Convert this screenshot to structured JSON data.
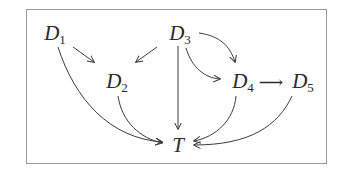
{
  "diagram": {
    "type": "directed-acyclic-graph",
    "colors": {
      "frame_border": "#9a9a9a",
      "edge": "#3a3a3a",
      "label": "#2a2a2a",
      "background": "#ffffff"
    },
    "nodes": [
      {
        "id": "D1",
        "base": "D",
        "sub": "1"
      },
      {
        "id": "D2",
        "base": "D",
        "sub": "2"
      },
      {
        "id": "D3",
        "base": "D",
        "sub": "3"
      },
      {
        "id": "D4",
        "base": "D",
        "sub": "4"
      },
      {
        "id": "D5",
        "base": "D",
        "sub": "5"
      },
      {
        "id": "T",
        "base": "T",
        "sub": ""
      }
    ],
    "edges": [
      {
        "from": "D1",
        "to": "D2"
      },
      {
        "from": "D1",
        "to": "T"
      },
      {
        "from": "D3",
        "to": "D2"
      },
      {
        "from": "D3",
        "to": "T"
      },
      {
        "from": "D3",
        "to": "D4",
        "style": "upper-curve"
      },
      {
        "from": "D3",
        "to": "D4",
        "style": "lower-curve"
      },
      {
        "from": "D4",
        "to": "D5"
      },
      {
        "from": "D2",
        "to": "T"
      },
      {
        "from": "D4",
        "to": "T"
      },
      {
        "from": "D5",
        "to": "T"
      }
    ],
    "inline_arrow": "⟶"
  }
}
